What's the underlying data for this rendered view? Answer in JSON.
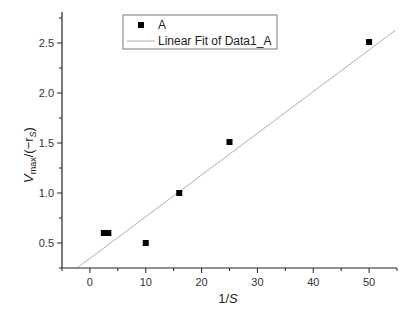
{
  "chart_data": {
    "type": "scatter",
    "title": "",
    "xlabel": "1/S",
    "ylabel": "V_max/(-r_S)",
    "xlim": [
      -5,
      55
    ],
    "ylim": [
      0.25,
      2.75
    ],
    "xticks": [
      0,
      10,
      20,
      30,
      40,
      50
    ],
    "yticks": [
      0.5,
      1.0,
      1.5,
      2.0,
      2.5
    ],
    "xtick_labels": [
      "0",
      "10",
      "20",
      "30",
      "40",
      "50"
    ],
    "ytick_labels": [
      "0.5",
      "1.0",
      "1.5",
      "2.0",
      "2.5"
    ],
    "grid": false,
    "legend_position": "top-left-inside",
    "series": [
      {
        "name": "A",
        "kind": "scatter",
        "marker": "square",
        "color": "#000000",
        "points": [
          [
            2.5,
            0.6
          ],
          [
            3.3,
            0.6
          ],
          [
            10,
            0.5
          ],
          [
            16,
            1.0
          ],
          [
            25,
            1.51
          ],
          [
            50,
            2.51
          ]
        ]
      },
      {
        "name": "Linear Fit of Data1_A",
        "kind": "line",
        "color": "#b0b0b0",
        "slope": 0.0417,
        "intercept": 0.346,
        "x_range": [
          -2.3,
          54.7
        ]
      }
    ]
  },
  "legend": {
    "items": [
      {
        "label": "A"
      },
      {
        "label": "Linear Fit of Data1_A"
      }
    ]
  },
  "axes": {
    "x_title": "1/",
    "x_title_italic": "S",
    "y_title_v": "V",
    "y_title_sub": "max",
    "y_title_rest": "/(−r",
    "y_title_sub2": "S",
    "y_title_close": ")"
  }
}
